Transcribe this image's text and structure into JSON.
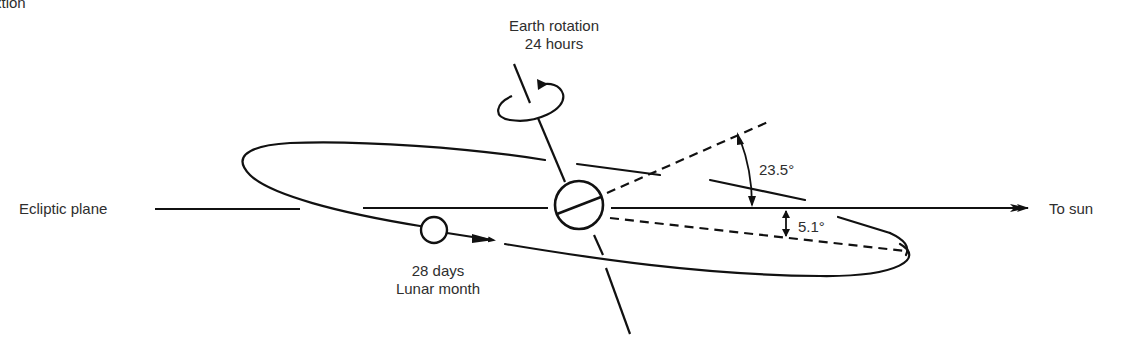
{
  "partial_caption": "xtion",
  "labels": {
    "earth_rotation_line1": "Earth rotation",
    "earth_rotation_line2": "24 hours",
    "ecliptic_plane": "Ecliptic plane",
    "to_sun": "To sun",
    "tilt_angle": "23.5°",
    "orbit_inclination": "5.1°",
    "lunar_line1": "28 days",
    "lunar_line2": "Lunar month"
  },
  "colors": {
    "stroke": "#111111",
    "text": "#2e2e2e",
    "background": "#ffffff"
  }
}
